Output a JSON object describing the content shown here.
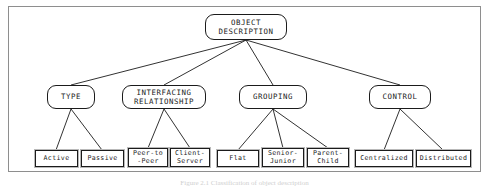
{
  "figure": {
    "caption": "Figure 2.1   Classification of object description",
    "frame_color": "#8e8e8e",
    "node_border_color": "#1b1b1b",
    "background_color": "#ffffff"
  },
  "diagram": {
    "type": "tree",
    "root": {
      "id": "object-description",
      "label": "OBJECT\nDESCRIPTION",
      "shape": "rounded-rectangle",
      "x": 205,
      "y": 14,
      "w": 82,
      "h": 26
    },
    "level2": [
      {
        "id": "type",
        "label": "TYPE",
        "shape": "rounded-rectangle",
        "x": 47,
        "y": 85,
        "w": 48,
        "h": 24,
        "children": [
          "active",
          "passive"
        ]
      },
      {
        "id": "interfacing-relationship",
        "label": "INTERFACING\nRELATIONSHIP",
        "shape": "rounded-rectangle",
        "x": 122,
        "y": 85,
        "w": 84,
        "h": 24,
        "children": [
          "peer-to-peer",
          "client-server"
        ]
      },
      {
        "id": "grouping",
        "label": "GROUPING",
        "shape": "rounded-rectangle",
        "x": 239,
        "y": 85,
        "w": 68,
        "h": 24,
        "children": [
          "flat",
          "senior-junior",
          "parent-child"
        ]
      },
      {
        "id": "control",
        "label": "CONTROL",
        "shape": "rounded-rectangle",
        "x": 369,
        "y": 85,
        "w": 62,
        "h": 24,
        "children": [
          "centralized",
          "distributed"
        ]
      }
    ],
    "leaves": [
      {
        "id": "active",
        "label": "Active",
        "x": 35,
        "y": 150,
        "w": 43,
        "h": 17
      },
      {
        "id": "passive",
        "label": "Passive",
        "x": 81,
        "y": 150,
        "w": 43,
        "h": 17
      },
      {
        "id": "peer-to-peer",
        "label": "Peer-to\n-Peer",
        "x": 128,
        "y": 148,
        "w": 40,
        "h": 19
      },
      {
        "id": "client-server",
        "label": "Client-\nServer",
        "x": 170,
        "y": 148,
        "w": 40,
        "h": 19
      },
      {
        "id": "flat",
        "label": "Flat",
        "x": 217,
        "y": 150,
        "w": 42,
        "h": 17
      },
      {
        "id": "senior-junior",
        "label": "Senior-\nJunior",
        "x": 262,
        "y": 148,
        "w": 42,
        "h": 19
      },
      {
        "id": "parent-child",
        "label": "Parent-\nChild",
        "x": 307,
        "y": 148,
        "w": 42,
        "h": 19
      },
      {
        "id": "centralized",
        "label": "Centralized",
        "x": 355,
        "y": 150,
        "w": 58,
        "h": 17
      },
      {
        "id": "distributed",
        "label": "Distributed",
        "x": 416,
        "y": 150,
        "w": 55,
        "h": 17
      }
    ]
  }
}
